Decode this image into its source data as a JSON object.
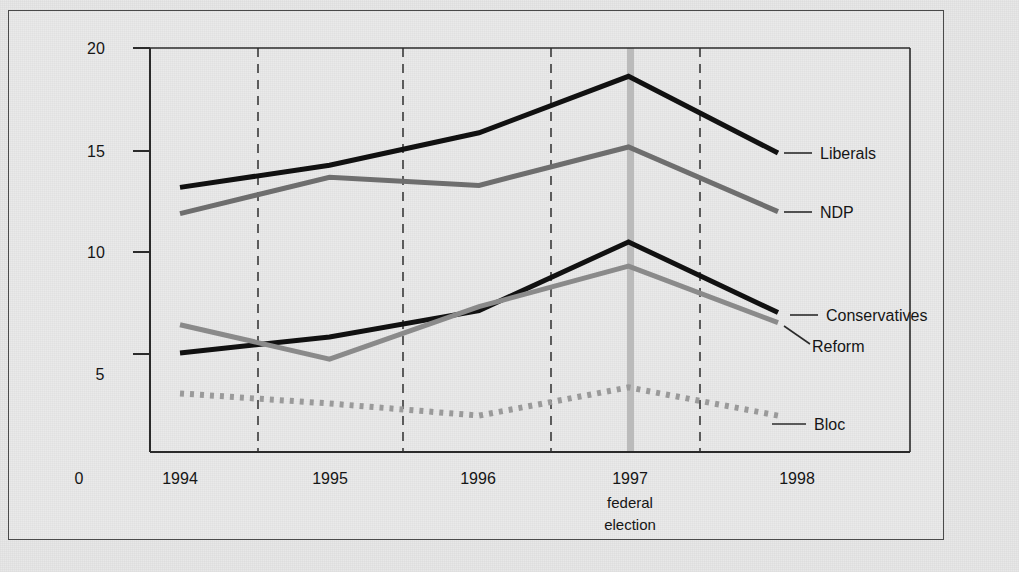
{
  "chart_data": {
    "type": "line",
    "title": "",
    "xlabel": "",
    "ylabel": "",
    "x": [
      1994,
      1995,
      1996,
      1997,
      1998
    ],
    "categories": [
      "1994",
      "1995",
      "1996",
      "1997",
      "1998"
    ],
    "xlim": [
      1994,
      1998
    ],
    "ylim": [
      0,
      20
    ],
    "grid": "vertical dashed gridlines at year midpoints",
    "legend_position": "right, inline labels at line ends",
    "annotations": [
      {
        "text": "federal election",
        "x": 1997,
        "note": "grey vertical band marking the 1997 federal election"
      }
    ],
    "yticks": [
      "0",
      "5",
      "10",
      "15",
      "20"
    ],
    "series": [
      {
        "name": "Liberals",
        "color": "#111111",
        "style": "solid",
        "width": 5,
        "values": [
          13.1,
          14.2,
          15.8,
          18.6,
          14.8
        ]
      },
      {
        "name": "NDP",
        "color": "#6e6e6e",
        "style": "solid",
        "width": 5,
        "values": [
          11.8,
          13.6,
          13.2,
          15.1,
          11.9
        ]
      },
      {
        "name": "Conservatives",
        "color": "#111111",
        "style": "solid",
        "width": 5,
        "values": [
          4.9,
          5.7,
          7.0,
          10.4,
          6.9
        ]
      },
      {
        "name": "Reform",
        "color": "#8a8a8a",
        "style": "solid",
        "width": 5,
        "values": [
          6.3,
          4.6,
          7.2,
          9.2,
          6.4
        ]
      },
      {
        "name": "Bloc",
        "color": "#9a9a9a",
        "style": "dotted",
        "width": 6,
        "values": [
          2.9,
          2.4,
          1.8,
          3.2,
          1.8
        ]
      }
    ]
  },
  "axes": {
    "y_ticks": [
      {
        "label": "20",
        "value": 20
      },
      {
        "label": "15",
        "value": 15
      },
      {
        "label": "10",
        "value": 10
      },
      {
        "label": "5",
        "value": 5
      },
      {
        "label": "0",
        "value": 0
      }
    ],
    "x_ticks": [
      {
        "label": "1994",
        "value": 1994
      },
      {
        "label": "1995",
        "value": 1995
      },
      {
        "label": "1996",
        "value": 1996
      },
      {
        "label": "1997",
        "value": 1997
      },
      {
        "label": "1998",
        "value": 1998
      }
    ]
  },
  "election_marker": {
    "line1": "federal",
    "line2": "election",
    "year": "1997",
    "color": "#b4b4b4"
  },
  "series_labels": {
    "liberals": "Liberals",
    "ndp": "NDP",
    "conservatives": "Conservatives",
    "reform": "Reform",
    "bloc": "Bloc"
  },
  "colors": {
    "dark_line": "#111111",
    "mid_grey_line": "#6e6e6e",
    "light_grey_line": "#8a8a8a",
    "dotted_grey": "#9a9a9a",
    "axis": "#333333",
    "background": "#e7e7e7",
    "election_band": "#b4b4b4"
  }
}
